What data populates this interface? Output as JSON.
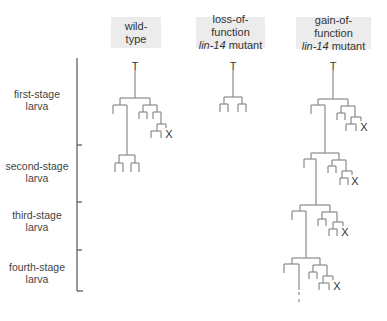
{
  "columns": [
    {
      "id": "wild-type",
      "line1": "wild-",
      "line2_italic": "",
      "line2": "type",
      "box": [
        111,
        17,
        50,
        31
      ]
    },
    {
      "id": "loss-of-function",
      "line1": "loss-of-function",
      "line2_italic": "lin-14",
      "line2": " mutant",
      "box": [
        196,
        17,
        69,
        31
      ]
    },
    {
      "id": "gain-of-function",
      "line1": "gain-of-function",
      "line2_italic": "lin-14",
      "line2": " mutant",
      "box": [
        296,
        17,
        75,
        32
      ]
    }
  ],
  "stages": [
    {
      "line1": "first-stage",
      "line2": "larva",
      "y": 88
    },
    {
      "line1": "second-stage",
      "line2": "larva",
      "y": 160
    },
    {
      "line1": "third-stage",
      "line2": "larva",
      "y": 209
    },
    {
      "line1": "fourth-stage",
      "line2": "larva",
      "y": 261
    }
  ],
  "timeline": {
    "x": 77,
    "y_top": 58,
    "y_bottom": 291,
    "ticks": [
      145,
      202,
      250,
      291
    ]
  },
  "marks": {
    "root": "T",
    "death": "X"
  },
  "colors": {
    "line": "#8a8a8a",
    "axis": "#555555",
    "header_bg": "#ececec"
  }
}
